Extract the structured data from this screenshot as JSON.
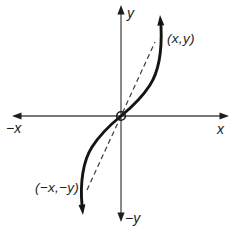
{
  "figure": {
    "type": "odd-function-symmetry-diagram",
    "axis_labels": {
      "y_top": "y",
      "y_bottom": "−y",
      "x_right": "x",
      "x_left": "−x"
    },
    "point_labels": {
      "upper": "(x,y)",
      "lower": "(−x,−y)"
    },
    "colors": {
      "background": "#ffffff",
      "axis": "#4a4a4a",
      "arrowhead": "#1d1d1d",
      "curve": "#141414",
      "dashed": "#3a3a3a",
      "origin_circle": "#1d1d1d"
    }
  }
}
